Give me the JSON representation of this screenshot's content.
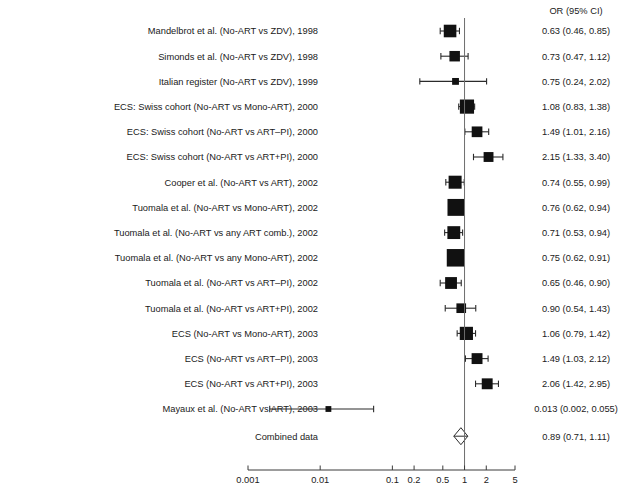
{
  "chart_data": {
    "type": "forest",
    "title": "",
    "header_right": "OR (95% CI)",
    "xlabel": "",
    "ylabel": "",
    "scale": "log",
    "xlim": [
      0.001,
      5
    ],
    "null_value": 1,
    "grid": false,
    "tick_labels": [
      "0.001",
      "0.01",
      "0.1",
      "0.2",
      "0.5",
      "1",
      "2",
      "5"
    ],
    "tick_values": [
      0.001,
      0.01,
      0.1,
      0.2,
      0.5,
      1,
      2,
      5
    ],
    "rows": [
      {
        "label": "Mandelbrot et al. (No-ART vs ZDV), 1998",
        "value": "0.63 (0.46, 0.85)",
        "or": 0.63,
        "lo": 0.46,
        "hi": 0.85,
        "weight": 7.5
      },
      {
        "label": "Simonds et al. (No-ART vs ZDV), 1998",
        "value": "0.73 (0.47, 1.12)",
        "or": 0.73,
        "lo": 0.47,
        "hi": 1.12,
        "weight": 5.2
      },
      {
        "label": "Italian register (No-ART vs ZDV), 1999",
        "value": "0.75 (0.24, 2.02)",
        "or": 0.75,
        "lo": 0.24,
        "hi": 2.02,
        "weight": 2.2
      },
      {
        "label": "ECS: Swiss cohort (No-ART vs Mono-ART), 2000",
        "value": "1.08 (0.83, 1.38)",
        "or": 1.08,
        "lo": 0.83,
        "hi": 1.38,
        "weight": 9.5
      },
      {
        "label": "ECS: Swiss cohort (No-ART vs ART–PI), 2000",
        "value": "1.49 (1.01, 2.16)",
        "or": 1.49,
        "lo": 1.01,
        "hi": 2.16,
        "weight": 5.4
      },
      {
        "label": "ECS: Swiss cohort (No-ART vs ART+PI), 2000",
        "value": "2.15 (1.33, 3.40)",
        "or": 2.15,
        "lo": 1.33,
        "hi": 3.4,
        "weight": 4.6
      },
      {
        "label": "Cooper et al. (No-ART vs ART), 2002",
        "value": "0.74 (0.55, 0.99)",
        "or": 0.74,
        "lo": 0.55,
        "hi": 0.99,
        "weight": 8.0
      },
      {
        "label": "Tuomala et al. (No-ART vs Mono-ART), 2002",
        "value": "0.76 (0.62, 0.94)",
        "or": 0.76,
        "lo": 0.62,
        "hi": 0.94,
        "weight": 13.5
      },
      {
        "label": "Tuomala et al. (No-ART vs any ART comb.), 2002",
        "value": "0.71 (0.53, 0.94)",
        "or": 0.71,
        "lo": 0.53,
        "hi": 0.94,
        "weight": 7.8
      },
      {
        "label": "Tuomala et al. (No-ART vs any Mono-ART), 2002",
        "value": "0.75 (0.62, 0.91)",
        "or": 0.75,
        "lo": 0.62,
        "hi": 0.91,
        "weight": 14.5
      },
      {
        "label": "Tuomala et al. (No-ART vs ART–PI), 2002",
        "value": "0.65 (0.46, 0.90)",
        "or": 0.65,
        "lo": 0.46,
        "hi": 0.9,
        "weight": 6.6
      },
      {
        "label": "Tuomala et al. (No-ART vs ART+PI), 2002",
        "value": "0.90 (0.54, 1.43)",
        "or": 0.9,
        "lo": 0.54,
        "hi": 1.43,
        "weight": 4.4
      },
      {
        "label": "ECS (No-ART vs Mono-ART), 2003",
        "value": "1.06 (0.79, 1.42)",
        "or": 1.06,
        "lo": 0.79,
        "hi": 1.42,
        "weight": 8.2
      },
      {
        "label": "ECS (No-ART vs ART–PI), 2003",
        "value": "1.49 (1.03, 2.12)",
        "or": 1.49,
        "lo": 1.03,
        "hi": 2.12,
        "weight": 5.6
      },
      {
        "label": "ECS (No-ART vs ART+PI), 2003",
        "value": "2.06 (1.42, 2.95)",
        "or": 2.06,
        "lo": 1.42,
        "hi": 2.95,
        "weight": 5.6
      },
      {
        "label": "Mayaux et al. (No-ART vs ART), 2003",
        "value": "0.013 (0.002, 0.055)",
        "or": 0.013,
        "lo": 0.002,
        "hi": 0.055,
        "weight": 1.6
      }
    ],
    "summary": {
      "label": "Combined data",
      "value": "0.89 (0.71, 1.11)",
      "or": 0.89,
      "lo": 0.71,
      "hi": 1.11
    }
  }
}
